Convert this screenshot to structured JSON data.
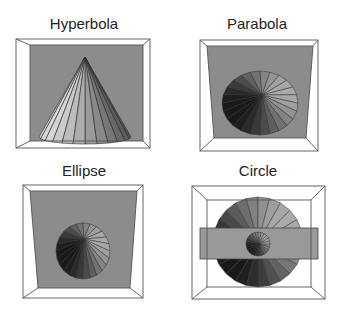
{
  "panels": [
    {
      "id": "hyperbola",
      "title": "Hyperbola"
    },
    {
      "id": "parabola",
      "title": "Parabola"
    },
    {
      "id": "ellipse",
      "title": "Ellipse"
    },
    {
      "id": "circle",
      "title": "Circle"
    }
  ],
  "colors": {
    "back_wall": "#8c8c8c",
    "plane": "#999999",
    "frame_edge": "#555555",
    "background": "#ffffff"
  },
  "cone_segments": 24
}
